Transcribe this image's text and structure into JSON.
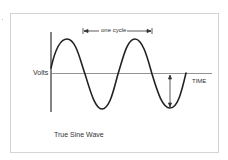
{
  "diagram": {
    "title": "True Sine Wave",
    "y_axis_label": "Volts",
    "x_axis_label": "TIME",
    "annotation": "one cycle",
    "colors": {
      "frame": "#d4d4d4",
      "wave": "#222222",
      "axis": "#555555",
      "text": "#333333"
    }
  }
}
